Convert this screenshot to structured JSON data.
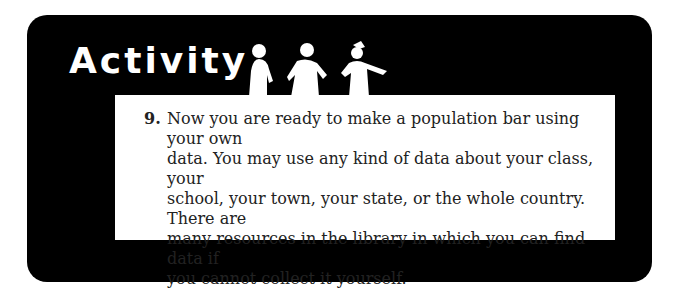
{
  "header": {
    "title": "Activity",
    "decoration": "silhouette-figures-icon"
  },
  "item": {
    "number": "9.",
    "lines": "Now you are ready to make a population bar using your own\ndata. You may use any kind of data about your class, your\nschool, your town, your state, or the whole country. There are\nmany resources in the library in which you can find data if\nyou cannot collect it yourself."
  },
  "colors": {
    "frame": "#000000",
    "panel": "#ffffff",
    "title": "#ffffff"
  }
}
